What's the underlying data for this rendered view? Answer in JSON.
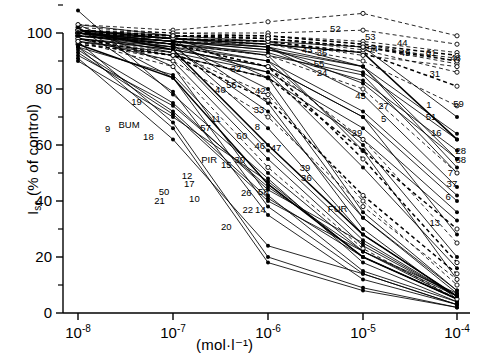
{
  "chart_data": {
    "type": "line",
    "title": "",
    "xlabel": "(mol·l⁻¹)",
    "ylabel": "I_sc (% of control)",
    "ylabel_main": "I",
    "ylabel_sub": "sc",
    "ylabel_rest": "(% of control)",
    "x": [
      "1e-8",
      "1e-7",
      "1e-6",
      "1e-5",
      "1e-4"
    ],
    "xtick_labels": [
      "10-8",
      "10-7",
      "10-6",
      "10-5",
      "10-4"
    ],
    "xtick_mantissa": "10",
    "xtick_exponents": [
      "-8",
      "-7",
      "-6",
      "-5",
      "-4"
    ],
    "ytick_labels": [
      "0",
      "20",
      "40",
      "60",
      "80",
      "100"
    ],
    "ytick_values": [
      0,
      20,
      40,
      60,
      80,
      100
    ],
    "ylim": [
      0,
      112
    ],
    "xlim_log": [
      -8.15,
      -3.9
    ],
    "grid": false,
    "legend": false,
    "minor_ticks_y": [
      10,
      30,
      50,
      70,
      90,
      110
    ],
    "marker_styles": [
      "filled-circle",
      "open-circle"
    ],
    "line_styles": [
      "solid",
      "dashed"
    ],
    "annotations": [
      {
        "label": "9",
        "x": 145,
        "y": 158
      },
      {
        "label": "BUM",
        "x": 174,
        "y": 153
      },
      {
        "label": "19",
        "x": 184,
        "y": 124
      },
      {
        "label": "18",
        "x": 200,
        "y": 167
      },
      {
        "label": "50",
        "x": 221,
        "y": 236
      },
      {
        "label": "21",
        "x": 215,
        "y": 247
      },
      {
        "label": "57",
        "x": 277,
        "y": 156
      },
      {
        "label": "PIR",
        "x": 282,
        "y": 196
      },
      {
        "label": "12",
        "x": 252,
        "y": 216
      },
      {
        "label": "17",
        "x": 255,
        "y": 226
      },
      {
        "label": "10",
        "x": 262,
        "y": 245
      },
      {
        "label": "15",
        "x": 305,
        "y": 203
      },
      {
        "label": "30",
        "x": 323,
        "y": 196
      },
      {
        "label": "20",
        "x": 305,
        "y": 280
      },
      {
        "label": "22",
        "x": 334,
        "y": 259
      },
      {
        "label": "14",
        "x": 351,
        "y": 259
      },
      {
        "label": "26",
        "x": 332,
        "y": 237
      },
      {
        "label": "58",
        "x": 355,
        "y": 236
      },
      {
        "label": "11",
        "x": 291,
        "y": 145
      },
      {
        "label": "40",
        "x": 297,
        "y": 109
      },
      {
        "label": "56",
        "x": 312,
        "y": 103
      },
      {
        "label": "60",
        "x": 326,
        "y": 166
      },
      {
        "label": "42",
        "x": 351,
        "y": 110
      },
      {
        "label": "33",
        "x": 349,
        "y": 134
      },
      {
        "label": "8",
        "x": 347,
        "y": 155
      },
      {
        "label": "46",
        "x": 350,
        "y": 179
      },
      {
        "label": "47",
        "x": 372,
        "y": 181
      },
      {
        "label": "32",
        "x": 318,
        "y": 82
      },
      {
        "label": "24",
        "x": 434,
        "y": 88
      },
      {
        "label": "43",
        "x": 414,
        "y": 59
      },
      {
        "label": "35",
        "x": 434,
        "y": 62
      },
      {
        "label": "55",
        "x": 430,
        "y": 76
      },
      {
        "label": "52",
        "x": 452,
        "y": 32
      },
      {
        "label": "53",
        "x": 499,
        "y": 43
      },
      {
        "label": "44",
        "x": 542,
        "y": 50
      },
      {
        "label": "54",
        "x": 502,
        "y": 57
      },
      {
        "label": "49",
        "x": 546,
        "y": 63
      },
      {
        "label": "61",
        "x": 581,
        "y": 63
      },
      {
        "label": "48",
        "x": 614,
        "y": 69
      },
      {
        "label": "31",
        "x": 586,
        "y": 89
      },
      {
        "label": "45",
        "x": 486,
        "y": 116
      },
      {
        "label": "27",
        "x": 517,
        "y": 129
      },
      {
        "label": "1",
        "x": 578,
        "y": 128
      },
      {
        "label": "59",
        "x": 618,
        "y": 126
      },
      {
        "label": "51",
        "x": 581,
        "y": 143
      },
      {
        "label": "5",
        "x": 517,
        "y": 145
      },
      {
        "label": "16",
        "x": 588,
        "y": 163
      },
      {
        "label": "29",
        "x": 481,
        "y": 163
      },
      {
        "label": "28",
        "x": 621,
        "y": 185
      },
      {
        "label": "38",
        "x": 621,
        "y": 196
      },
      {
        "label": "7",
        "x": 607,
        "y": 213
      },
      {
        "label": "37",
        "x": 609,
        "y": 226
      },
      {
        "label": "39",
        "x": 411,
        "y": 206
      },
      {
        "label": "36",
        "x": 413,
        "y": 219
      },
      {
        "label": "6",
        "x": 604,
        "y": 243
      },
      {
        "label": "FUR",
        "x": 455,
        "y": 258
      },
      {
        "label": "13",
        "x": 586,
        "y": 275
      }
    ],
    "series": [
      {
        "name": "1",
        "style": "solid",
        "marker": "filled-circle",
        "values": [
          101,
          98,
          96,
          93,
          62
        ]
      },
      {
        "name": "2",
        "style": "solid",
        "marker": "filled-circle",
        "values": [
          103,
          99,
          97,
          95,
          70
        ]
      },
      {
        "name": "3",
        "style": "solid",
        "marker": "filled-circle",
        "values": [
          100,
          97,
          94,
          88,
          55
        ]
      },
      {
        "name": "4",
        "style": "solid",
        "marker": "filled-circle",
        "values": [
          99,
          96,
          92,
          85,
          50
        ]
      },
      {
        "name": "5",
        "style": "solid",
        "marker": "filled-circle",
        "values": [
          100,
          97,
          95,
          78,
          45
        ]
      },
      {
        "name": "6",
        "style": "solid",
        "marker": "filled-circle",
        "values": [
          98,
          94,
          88,
          70,
          28
        ]
      },
      {
        "name": "7",
        "style": "solid",
        "marker": "filled-circle",
        "values": [
          97,
          93,
          86,
          66,
          36
        ]
      },
      {
        "name": "8",
        "style": "dashed",
        "marker": "open-circle",
        "values": [
          96,
          92,
          84,
          58,
          30
        ]
      },
      {
        "name": "9",
        "style": "solid",
        "marker": "filled-circle",
        "values": [
          108,
          78,
          48,
          18,
          4
        ]
      },
      {
        "name": "10",
        "style": "solid",
        "marker": "filled-circle",
        "values": [
          93,
          71,
          40,
          22,
          7
        ]
      },
      {
        "name": "11",
        "style": "solid",
        "marker": "filled-circle",
        "values": [
          101,
          98,
          75,
          30,
          5
        ]
      },
      {
        "name": "12",
        "style": "solid",
        "marker": "filled-circle",
        "values": [
          95,
          75,
          44,
          25,
          6
        ]
      },
      {
        "name": "13",
        "style": "solid",
        "marker": "filled-circle",
        "values": [
          100,
          97,
          92,
          58,
          12
        ]
      },
      {
        "name": "14",
        "style": "solid",
        "marker": "filled-circle",
        "values": [
          95,
          85,
          50,
          22,
          5
        ]
      },
      {
        "name": "15",
        "style": "solid",
        "marker": "filled-circle",
        "values": [
          101,
          94,
          60,
          28,
          6
        ]
      },
      {
        "name": "16",
        "style": "dashed",
        "marker": "open-circle",
        "values": [
          99,
          96,
          92,
          80,
          50
        ]
      },
      {
        "name": "17",
        "style": "solid",
        "marker": "filled-circle",
        "values": [
          94,
          72,
          41,
          20,
          5
        ]
      },
      {
        "name": "18",
        "style": "solid",
        "marker": "filled-circle",
        "values": [
          102,
          79,
          35,
          12,
          3
        ]
      },
      {
        "name": "19",
        "style": "solid",
        "marker": "filled-circle",
        "values": [
          103,
          88,
          42,
          15,
          4
        ]
      },
      {
        "name": "20",
        "style": "solid",
        "marker": "filled-circle",
        "values": [
          91,
          62,
          24,
          14,
          3
        ]
      },
      {
        "name": "21",
        "style": "solid",
        "marker": "filled-circle",
        "values": [
          95,
          66,
          18,
          8,
          2
        ]
      },
      {
        "name": "22",
        "style": "solid",
        "marker": "filled-circle",
        "values": [
          96,
          84,
          46,
          20,
          5
        ]
      },
      {
        "name": "24",
        "style": "dashed",
        "marker": "open-circle",
        "values": [
          99,
          97,
          96,
          90,
          74
        ]
      },
      {
        "name": "26",
        "style": "solid",
        "marker": "filled-circle",
        "values": [
          98,
          90,
          55,
          24,
          6
        ]
      },
      {
        "name": "27",
        "style": "solid",
        "marker": "filled-circle",
        "values": [
          100,
          98,
          95,
          82,
          55
        ]
      },
      {
        "name": "28",
        "style": "solid",
        "marker": "filled-circle",
        "values": [
          98,
          95,
          90,
          72,
          42
        ]
      },
      {
        "name": "29",
        "style": "solid",
        "marker": "filled-circle",
        "values": [
          100,
          96,
          90,
          60,
          20
        ]
      },
      {
        "name": "30",
        "style": "solid",
        "marker": "filled-circle",
        "values": [
          100,
          93,
          58,
          26,
          6
        ]
      },
      {
        "name": "31",
        "style": "dashed",
        "marker": "open-circle",
        "values": [
          100,
          98,
          97,
          93,
          81
        ]
      },
      {
        "name": "32",
        "style": "solid",
        "marker": "filled-circle",
        "values": [
          100,
          98,
          97,
          88,
          52
        ]
      },
      {
        "name": "33",
        "style": "dashed",
        "marker": "open-circle",
        "values": [
          97,
          90,
          70,
          38,
          12
        ]
      },
      {
        "name": "35",
        "style": "dashed",
        "marker": "open-circle",
        "values": [
          101,
          99,
          98,
          94,
          86
        ]
      },
      {
        "name": "36",
        "style": "solid",
        "marker": "filled-circle",
        "values": [
          99,
          95,
          86,
          52,
          16
        ]
      },
      {
        "name": "37",
        "style": "solid",
        "marker": "filled-circle",
        "values": [
          97,
          92,
          84,
          62,
          33
        ]
      },
      {
        "name": "38",
        "style": "solid",
        "marker": "filled-circle",
        "values": [
          98,
          94,
          88,
          70,
          40
        ]
      },
      {
        "name": "39",
        "style": "dashed",
        "marker": "open-circle",
        "values": [
          99,
          96,
          88,
          55,
          18
        ]
      },
      {
        "name": "40",
        "style": "solid",
        "marker": "filled-circle",
        "values": [
          101,
          99,
          84,
          36,
          8
        ]
      },
      {
        "name": "42",
        "style": "dashed",
        "marker": "open-circle",
        "values": [
          99,
          96,
          88,
          62,
          25
        ]
      },
      {
        "name": "43",
        "style": "dashed",
        "marker": "open-circle",
        "values": [
          102,
          100,
          99,
          96,
          90
        ]
      },
      {
        "name": "44",
        "style": "dashed",
        "marker": "open-circle",
        "values": [
          101,
          99,
          99,
          97,
          93
        ]
      },
      {
        "name": "45",
        "style": "solid",
        "marker": "filled-circle",
        "values": [
          100,
          97,
          94,
          86,
          62
        ]
      },
      {
        "name": "46",
        "style": "dashed",
        "marker": "open-circle",
        "values": [
          98,
          93,
          78,
          40,
          10
        ]
      },
      {
        "name": "47",
        "style": "dashed",
        "marker": "open-circle",
        "values": [
          98,
          92,
          76,
          42,
          14
        ]
      },
      {
        "name": "48",
        "style": "dashed",
        "marker": "open-circle",
        "values": [
          100,
          99,
          98,
          95,
          89
        ]
      },
      {
        "name": "49",
        "style": "dashed",
        "marker": "open-circle",
        "values": [
          101,
          99,
          98,
          95,
          91
        ]
      },
      {
        "name": "50",
        "style": "solid",
        "marker": "filled-circle",
        "values": [
          97,
          68,
          20,
          9,
          2
        ]
      },
      {
        "name": "51",
        "style": "solid",
        "marker": "filled-circle",
        "values": [
          99,
          96,
          93,
          83,
          58
        ]
      },
      {
        "name": "52",
        "style": "dashed",
        "marker": "open-circle",
        "values": [
          103,
          101,
          104,
          107,
          99
        ]
      },
      {
        "name": "53",
        "style": "dashed",
        "marker": "open-circle",
        "values": [
          101,
          100,
          100,
          101,
          96
        ]
      },
      {
        "name": "54",
        "style": "dashed",
        "marker": "open-circle",
        "values": [
          100,
          99,
          99,
          96,
          92
        ]
      },
      {
        "name": "55",
        "style": "dashed",
        "marker": "open-circle",
        "values": [
          100,
          98,
          97,
          92,
          88
        ]
      },
      {
        "name": "56",
        "style": "solid",
        "marker": "filled-circle",
        "values": [
          100,
          97,
          80,
          34,
          7
        ]
      },
      {
        "name": "57",
        "style": "solid",
        "marker": "filled-circle",
        "values": [
          90,
          70,
          47,
          20,
          5
        ]
      },
      {
        "name": "58",
        "style": "dashed",
        "marker": "open-circle",
        "values": [
          97,
          88,
          52,
          23,
          5
        ]
      },
      {
        "name": "59",
        "style": "solid",
        "marker": "filled-circle",
        "values": [
          99,
          97,
          95,
          88,
          64
        ]
      },
      {
        "name": "60",
        "style": "solid",
        "marker": "filled-circle",
        "values": [
          100,
          96,
          66,
          28,
          6
        ]
      },
      {
        "name": "61",
        "style": "dashed",
        "marker": "open-circle",
        "values": [
          100,
          99,
          98,
          95,
          90
        ]
      },
      {
        "name": "BUM",
        "style": "solid",
        "marker": "filled-circle",
        "values": [
          102,
          84,
          38,
          14,
          3
        ]
      },
      {
        "name": "PIR",
        "style": "solid",
        "marker": "filled-circle",
        "values": [
          92,
          74,
          45,
          22,
          6
        ]
      },
      {
        "name": "FUR",
        "style": "solid",
        "marker": "filled-circle",
        "values": [
          100,
          95,
          72,
          34,
          8
        ]
      }
    ]
  }
}
